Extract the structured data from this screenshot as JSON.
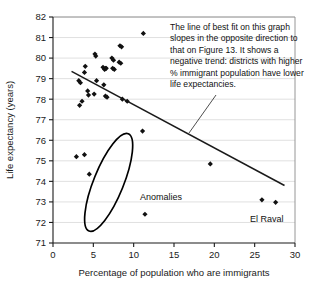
{
  "chart_data": {
    "type": "scatter",
    "title": "",
    "xlabel": "Percentage of population who are immigrants",
    "ylabel": "Life expectancy (years)",
    "xlim": [
      0,
      30
    ],
    "ylim": [
      71,
      82
    ],
    "xticks": [
      0,
      5,
      10,
      15,
      20,
      25,
      30
    ],
    "yticks": [
      71,
      72,
      73,
      74,
      75,
      76,
      77,
      78,
      79,
      80,
      81,
      82
    ],
    "grid": "horizontal",
    "legend": "none",
    "series": [
      {
        "name": "Districts",
        "points": [
          [
            3.2,
            78.9
          ],
          [
            3.4,
            78.8
          ],
          [
            3.3,
            77.7
          ],
          [
            3.6,
            77.9
          ],
          [
            4.0,
            79.6
          ],
          [
            3.9,
            79.3
          ],
          [
            4.3,
            78.4
          ],
          [
            4.4,
            78.2
          ],
          [
            5.2,
            80.2
          ],
          [
            5.3,
            80.1
          ],
          [
            5.4,
            78.9
          ],
          [
            5.1,
            78.25
          ],
          [
            6.2,
            79.55
          ],
          [
            6.5,
            79.5
          ],
          [
            6.4,
            79.45
          ],
          [
            6.6,
            79.5
          ],
          [
            6.3,
            78.7
          ],
          [
            6.5,
            78.15
          ],
          [
            6.7,
            78.1
          ],
          [
            7.3,
            80.0
          ],
          [
            7.5,
            79.9
          ],
          [
            7.4,
            79.5
          ],
          [
            7.6,
            79.45
          ],
          [
            8.3,
            80.6
          ],
          [
            8.5,
            80.55
          ],
          [
            8.2,
            79.8
          ],
          [
            8.4,
            79.75
          ],
          [
            8.6,
            78.0
          ],
          [
            9.2,
            77.9
          ],
          [
            11.2,
            81.2
          ],
          [
            11.1,
            76.45
          ],
          [
            19.5,
            74.85
          ],
          [
            25.9,
            73.1
          ],
          [
            27.6,
            72.98
          ],
          [
            2.9,
            75.2
          ],
          [
            3.9,
            75.3
          ],
          [
            4.5,
            74.35
          ],
          [
            11.4,
            72.4
          ]
        ]
      }
    ],
    "trendline": {
      "description": "line of best fit",
      "x0": 2.3,
      "y0": 79.35,
      "x1": 28.7,
      "y1": 73.8
    },
    "annotations": [
      {
        "name": "trend-note",
        "lines": [
          "The line of best fit on this graph",
          "slopes in the opposite direction to",
          "that on Figure 13. It shows a",
          "negative trend: districts with higher",
          "% immigrant population have lower",
          "life expectancies."
        ]
      },
      {
        "name": "anomalies-label",
        "text": "Anomalies"
      },
      {
        "name": "el-raval-label",
        "text": "El Raval"
      }
    ],
    "highlight_ellipse": {
      "name": "anomalies-ellipse",
      "cx": 6.9,
      "cy": 73.95,
      "rx": 1.85,
      "ry": 2.55,
      "rotation_deg": 22
    }
  },
  "colors": {
    "point": "#111111",
    "trendline": "#1a1a1a",
    "grid": "#d8d8d8",
    "axis": "#1a1a1a",
    "ellipse": "#000000",
    "background": "#ffffff"
  }
}
